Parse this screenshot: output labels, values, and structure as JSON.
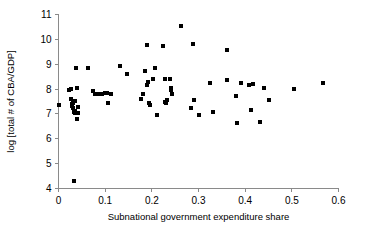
{
  "chart_data": {
    "type": "scatter",
    "title": "",
    "xlabel": "Subnational government expenditure share",
    "ylabel": "log [total # of CBA/GDP]",
    "xlim": [
      0,
      0.6
    ],
    "ylim": [
      4,
      11
    ],
    "grid": false,
    "legend": false,
    "marker": {
      "shape": "square",
      "color": "#000000",
      "size_px": 4
    },
    "xticks": [
      0,
      0.1,
      0.2,
      0.3,
      0.4,
      0.5,
      0.6
    ],
    "xticklabels": [
      "0",
      "0.1",
      "0.2",
      "0.3",
      "0.4",
      "0.5",
      "0.6"
    ],
    "yticks": [
      4,
      5,
      6,
      7,
      8,
      9,
      10,
      11
    ],
    "yticklabels": [
      "4",
      "5",
      "6",
      "7",
      "8",
      "9",
      "10",
      "11"
    ],
    "series": [
      {
        "name": "countries",
        "points": [
          [
            0.002,
            7.37
          ],
          [
            0.022,
            7.95
          ],
          [
            0.026,
            8.0
          ],
          [
            0.027,
            7.62
          ],
          [
            0.028,
            7.4
          ],
          [
            0.029,
            7.33
          ],
          [
            0.03,
            7.45
          ],
          [
            0.031,
            7.22
          ],
          [
            0.033,
            4.3
          ],
          [
            0.034,
            7.08
          ],
          [
            0.035,
            7.12
          ],
          [
            0.036,
            7.05
          ],
          [
            0.036,
            7.52
          ],
          [
            0.038,
            8.86
          ],
          [
            0.039,
            6.78
          ],
          [
            0.04,
            8.06
          ],
          [
            0.041,
            7.28
          ],
          [
            0.042,
            7.02
          ],
          [
            0.063,
            8.83
          ],
          [
            0.073,
            7.92
          ],
          [
            0.079,
            7.8
          ],
          [
            0.086,
            7.8
          ],
          [
            0.094,
            7.79
          ],
          [
            0.1,
            7.84
          ],
          [
            0.104,
            7.86
          ],
          [
            0.107,
            7.44
          ],
          [
            0.112,
            7.82
          ],
          [
            0.132,
            8.94
          ],
          [
            0.146,
            8.62
          ],
          [
            0.176,
            7.62
          ],
          [
            0.182,
            7.82
          ],
          [
            0.186,
            8.74
          ],
          [
            0.189,
            9.78
          ],
          [
            0.19,
            8.18
          ],
          [
            0.192,
            8.3
          ],
          [
            0.194,
            7.42
          ],
          [
            0.196,
            7.36
          ],
          [
            0.203,
            8.42
          ],
          [
            0.206,
            8.84
          ],
          [
            0.212,
            6.96
          ],
          [
            0.223,
            9.74
          ],
          [
            0.228,
            8.42
          ],
          [
            0.229,
            7.5
          ],
          [
            0.23,
            7.44
          ],
          [
            0.233,
            7.58
          ],
          [
            0.238,
            8.4
          ],
          [
            0.24,
            7.98
          ],
          [
            0.241,
            8.04
          ],
          [
            0.243,
            7.8
          ],
          [
            0.262,
            10.55
          ],
          [
            0.283,
            7.22
          ],
          [
            0.289,
            9.82
          ],
          [
            0.29,
            7.58
          ],
          [
            0.3,
            6.95
          ],
          [
            0.325,
            8.26
          ],
          [
            0.331,
            7.08
          ],
          [
            0.36,
            9.56
          ],
          [
            0.362,
            8.37
          ],
          [
            0.38,
            7.72
          ],
          [
            0.382,
            6.63
          ],
          [
            0.392,
            8.26
          ],
          [
            0.409,
            8.15
          ],
          [
            0.412,
            7.17
          ],
          [
            0.416,
            8.2
          ],
          [
            0.432,
            6.68
          ],
          [
            0.441,
            8.05
          ],
          [
            0.452,
            7.56
          ],
          [
            0.505,
            8.01
          ],
          [
            0.566,
            8.23
          ]
        ]
      }
    ]
  }
}
